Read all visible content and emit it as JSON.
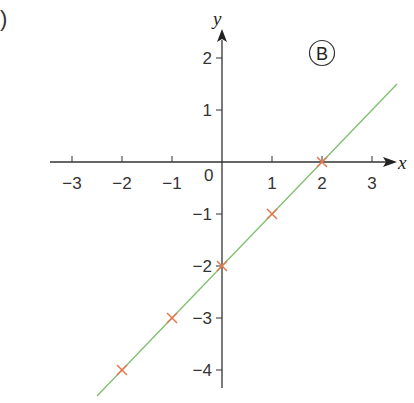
{
  "figure": {
    "part_label_fragment": ")",
    "badge_label": "B"
  },
  "axes": {
    "x_name": "x",
    "y_name": "y",
    "origin_label": "0",
    "x_ticks": [
      "−3",
      "−2",
      "−1",
      "1",
      "2",
      "3"
    ],
    "y_ticks": [
      "2",
      "1",
      "−1",
      "−2",
      "−3",
      "−4"
    ]
  },
  "colors": {
    "axis": "#333333",
    "line": "#7dbf6e",
    "points": "#e8734a"
  },
  "chart_data": {
    "type": "line",
    "title": "",
    "annotation": "B",
    "xlabel": "x",
    "ylabel": "y",
    "xlim": [
      -3.5,
      3.5
    ],
    "ylim": [
      -4.5,
      2.5
    ],
    "x_tick_values": [
      -3,
      -2,
      -1,
      0,
      1,
      2,
      3
    ],
    "y_tick_values": [
      -4,
      -3,
      -2,
      -1,
      0,
      1,
      2
    ],
    "grid": false,
    "legend": null,
    "series": [
      {
        "name": "line y = x - 2",
        "kind": "line",
        "equation": "y = x - 2",
        "color": "#7dbf6e",
        "x": [
          -2.5,
          3.5
        ],
        "y": [
          -4.5,
          1.5
        ]
      },
      {
        "name": "plotted points",
        "kind": "scatter",
        "marker": "x",
        "color": "#e8734a",
        "x": [
          -2,
          -1,
          0,
          1,
          2
        ],
        "y": [
          -4,
          -3,
          -2,
          -1,
          0
        ]
      }
    ]
  }
}
